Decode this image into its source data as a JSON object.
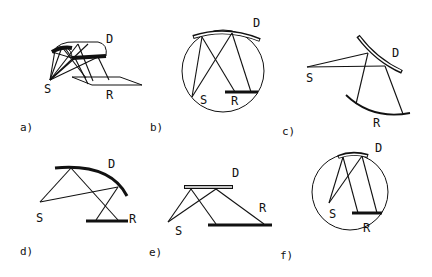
{
  "figure": {
    "panels": [
      {
        "id": "a",
        "caption": "a)",
        "source": "S",
        "detector": "D",
        "receiver": "R"
      },
      {
        "id": "b",
        "caption": "b)",
        "source": "S",
        "detector": "D",
        "receiver": "R"
      },
      {
        "id": "c",
        "caption": "c)",
        "source": "S",
        "detector": "D",
        "receiver": "R"
      },
      {
        "id": "d",
        "caption": "d)",
        "source": "S",
        "detector": "D",
        "receiver": "R"
      },
      {
        "id": "e",
        "caption": "e)",
        "source": "S",
        "detector": "D",
        "receiver": "R"
      },
      {
        "id": "f",
        "caption": "f)",
        "source": "S",
        "detector": "D",
        "receiver": "R"
      }
    ]
  }
}
